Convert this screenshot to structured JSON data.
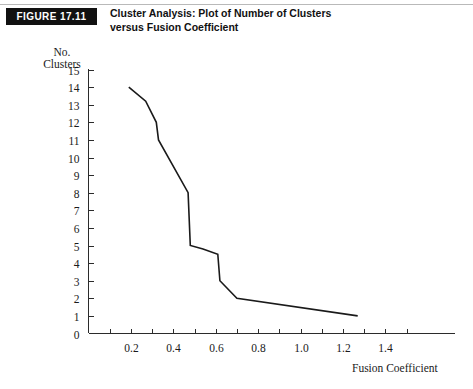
{
  "figure": {
    "badge_label": "FIGURE 17.11",
    "title_line_1": "Cluster Analysis: Plot of Number of Clusters",
    "title_line_2": "versus Fusion Coefficient"
  },
  "chart_data": {
    "type": "line",
    "title": "Cluster Analysis: Plot of Number of Clusters versus Fusion Coefficient",
    "xlabel": "Fusion Coefficient",
    "ylabel_line_1": "No.",
    "ylabel_line_2": "Clusters",
    "xlim": [
      0.0,
      1.5
    ],
    "ylim": [
      0,
      15
    ],
    "grid": false,
    "legend": "none",
    "x_major_ticks": [
      0.2,
      0.4,
      0.6,
      0.8,
      1.0,
      1.2,
      1.4
    ],
    "x_major_tick_labels": [
      "0.2",
      "0.4",
      "0.6",
      "0.8",
      "1.0",
      "1.2",
      "1.4"
    ],
    "x_minor_ticks": [
      0.1,
      0.3,
      0.5,
      0.7,
      0.9,
      1.1,
      1.3,
      1.5
    ],
    "y_ticks": [
      0,
      1,
      2,
      3,
      4,
      5,
      6,
      7,
      8,
      9,
      10,
      11,
      12,
      13,
      14,
      15
    ],
    "y_tick_labels": [
      "0",
      "1",
      "2",
      "3",
      "4",
      "5",
      "6",
      "7",
      "8",
      "9",
      "10",
      "11",
      "12",
      "13",
      "14",
      "15"
    ],
    "series": [
      {
        "name": "Number of clusters vs fusion coefficient",
        "color": "#1a1a1a",
        "x": [
          0.19,
          0.27,
          0.32,
          0.33,
          0.47,
          0.48,
          0.54,
          0.61,
          0.62,
          0.7,
          1.27
        ],
        "y": [
          14.0,
          13.2,
          12.0,
          11.0,
          8.0,
          5.0,
          4.8,
          4.5,
          3.0,
          2.0,
          1.0
        ]
      }
    ]
  },
  "colors": {
    "badge_background": "#111111",
    "badge_text": "#ffffff",
    "axis": "#2b2b2b",
    "line": "#1a1a1a",
    "rule": "#b9b9b9",
    "page_background": "#ffffff"
  }
}
